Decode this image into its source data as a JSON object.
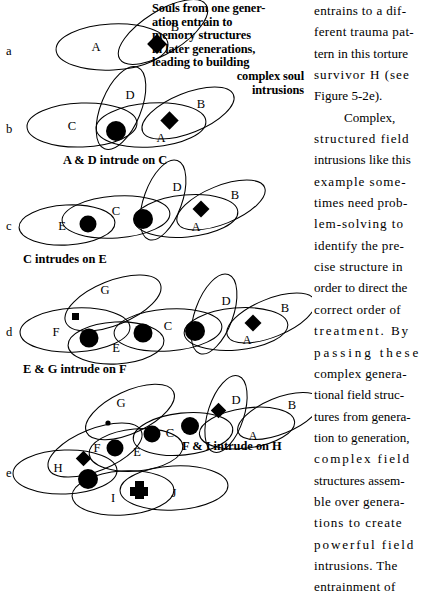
{
  "figure": {
    "inset_caption": {
      "lines": [
        "Souls from one gener-",
        "ation entrain to",
        "memory structures",
        "in later generations,",
        "leading to building",
        "complex soul",
        "intrusions"
      ]
    },
    "row_captions": {
      "after_b": "A & D intrude on C",
      "after_c": "C intrudes on E",
      "after_d": "E & G intrude on F",
      "after_e": "F & I intrude on H"
    },
    "rows": [
      {
        "letter": "a",
        "ellipse_labels": [
          "A",
          "B"
        ]
      },
      {
        "letter": "b",
        "ellipse_labels": [
          "C",
          "D",
          "A",
          "B"
        ]
      },
      {
        "letter": "c",
        "ellipse_labels": [
          "E",
          "C",
          "D",
          "A",
          "B"
        ]
      },
      {
        "letter": "d",
        "ellipse_labels": [
          "F",
          "G",
          "E",
          "C",
          "D",
          "A",
          "B"
        ]
      },
      {
        "letter": "e",
        "ellipse_labels": [
          "H",
          "F",
          "G",
          "E",
          "C",
          "D",
          "A",
          "B",
          "I",
          "J"
        ]
      }
    ],
    "marker_shapes": [
      "diamond",
      "circle",
      "small-square",
      "small-dot",
      "plus"
    ],
    "ink_color": "#000000",
    "background_color": "#ffffff"
  },
  "body_text": {
    "lines": [
      "entrains to a dif-",
      "ferent trauma pat-",
      "tern in this torture",
      "survivor H (see",
      "Figure 5-2e).",
      "Complex,",
      "structured field",
      "intrusions like this",
      "example some-",
      "times need prob-",
      "lem-solving to",
      "identify the pre-",
      "cise structure in",
      "order to direct the",
      "correct order of",
      "treatment. By",
      "passing these",
      "complex genera-",
      "tional field struc-",
      "tures from genera-",
      "tion to generation,",
      "complex field",
      "structures assem-",
      "ble over genera-",
      "tions to create",
      "powerful field",
      "intrusions. The",
      "entrainment of"
    ]
  }
}
